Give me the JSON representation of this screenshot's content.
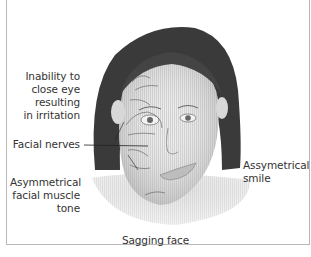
{
  "labels": {
    "eye": [
      "Inability to",
      "close eye",
      "resulting",
      "in irritation"
    ],
    "nerves": "Facial nerves",
    "muscle": [
      "Asymmetrical",
      "facial muscle",
      "tone"
    ],
    "smile": [
      "Assymetrical",
      "smile"
    ],
    "caption": "Sagging face"
  },
  "colors": {
    "hair": "#3a3a3a",
    "skin": "#dcdcdc",
    "nerve": "#6a6a6a",
    "border": "#b8b8b8"
  }
}
